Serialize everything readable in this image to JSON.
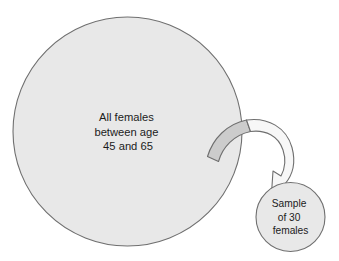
{
  "diagram": {
    "background_color": "#ffffff",
    "population": {
      "shape": "circle",
      "fill_color": "#e8e8e8",
      "stroke_color": "#6f6f6f",
      "label_lines": [
        "All females",
        "between age",
        "45 and 65"
      ]
    },
    "sample": {
      "shape": "circle",
      "fill_color": "#e8e8e8",
      "stroke_color": "#6f6f6f",
      "label_lines": [
        "Sample",
        "of 30",
        "females"
      ]
    },
    "arrow": {
      "name": "curved-sampling-arrow",
      "tail_fill_color": "#cccccc",
      "head_fill_color": "#f7f7f7",
      "stroke_color": "#6f6f6f",
      "direction": "population-to-sample"
    }
  }
}
